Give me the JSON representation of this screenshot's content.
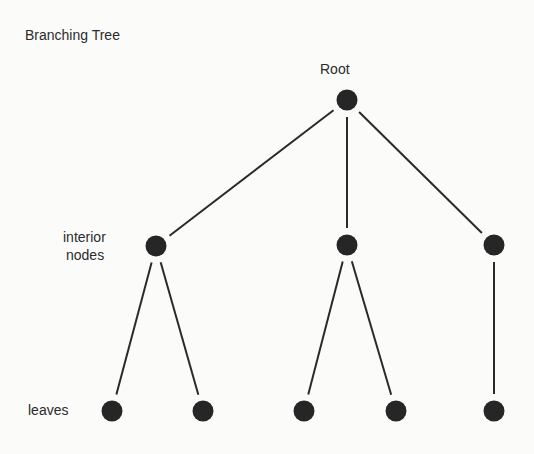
{
  "title": "Branching Tree",
  "labels": {
    "root": "Root",
    "interior_line1": "interior",
    "interior_line2": "nodes",
    "leaves": "leaves"
  },
  "colors": {
    "node": "#262626",
    "edge": "#2a2a2a",
    "background": "#fbfbfa"
  },
  "nodes": [
    {
      "id": "root",
      "x": 347,
      "y": 100
    },
    {
      "id": "i1",
      "x": 156,
      "y": 246
    },
    {
      "id": "i2",
      "x": 347,
      "y": 245
    },
    {
      "id": "i3",
      "x": 494,
      "y": 245
    },
    {
      "id": "l1",
      "x": 112,
      "y": 411
    },
    {
      "id": "l2",
      "x": 203,
      "y": 411
    },
    {
      "id": "l3",
      "x": 304,
      "y": 411
    },
    {
      "id": "l4",
      "x": 396,
      "y": 411
    },
    {
      "id": "l5",
      "x": 494,
      "y": 411
    }
  ],
  "edges": [
    [
      "root",
      "i1"
    ],
    [
      "root",
      "i2"
    ],
    [
      "root",
      "i3"
    ],
    [
      "i1",
      "l1"
    ],
    [
      "i1",
      "l2"
    ],
    [
      "i2",
      "l3"
    ],
    [
      "i2",
      "l4"
    ],
    [
      "i3",
      "l5"
    ]
  ]
}
